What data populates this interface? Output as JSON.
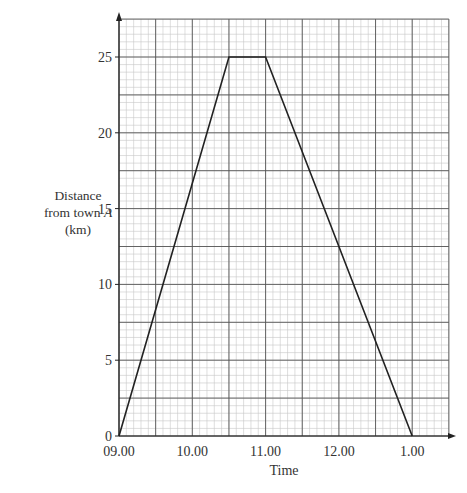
{
  "chart_data": {
    "type": "line",
    "title": "",
    "xlabel": "Time",
    "ylabel_lines": [
      "Distance",
      "from town",
      "A",
      "(km)"
    ],
    "ylabel": "Distance from town A (km)",
    "x_tick_labels": [
      "09.00",
      "10.00",
      "11.00",
      "12.00",
      "1.00"
    ],
    "x_tick_hours": [
      0,
      1,
      2,
      3,
      4
    ],
    "y_tick_labels": [
      "0",
      "5",
      "10",
      "15",
      "20",
      "25"
    ],
    "y_ticks": [
      0,
      5,
      10,
      15,
      20,
      25
    ],
    "xlim_hours_after_0900": [
      0,
      4.5
    ],
    "ylim": [
      0,
      27.5
    ],
    "grid": {
      "major_x_hours": 0.5,
      "minor_x_hours": 0.1,
      "major_y_km": 2.5,
      "minor_y_km": 0.5
    },
    "series": [
      {
        "name": "Journey",
        "points": [
          {
            "time": "09.00",
            "x": 0,
            "y": 0
          },
          {
            "time": "10.30",
            "x": 1.5,
            "y": 25
          },
          {
            "time": "11.00",
            "x": 2.0,
            "y": 25
          },
          {
            "time": "1.00",
            "x": 4.0,
            "y": 0
          }
        ]
      }
    ]
  },
  "colors": {
    "major_grid": "#555555",
    "minor_grid": "#c8c8c8",
    "line": "#222222",
    "axis": "#222222"
  }
}
